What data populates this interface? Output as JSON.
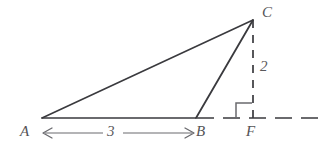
{
  "figure": {
    "type": "geometry-diagram",
    "background_color": "#ffffff",
    "stroke_color": "#3a3a3e",
    "label_color": "#555457",
    "points": {
      "A": {
        "label": "A",
        "x": 42,
        "y": 118
      },
      "B": {
        "label": "B",
        "x": 196,
        "y": 118
      },
      "C": {
        "label": "C",
        "x": 253,
        "y": 20
      },
      "F": {
        "label": "F",
        "x": 253,
        "y": 118
      }
    },
    "segments": [
      {
        "name": "AC",
        "from": "A",
        "to": "C",
        "style": "solid"
      },
      {
        "name": "AB",
        "from": "A",
        "to": "B",
        "style": "solid"
      },
      {
        "name": "BC",
        "from": "B",
        "to": "C",
        "style": "solid"
      },
      {
        "name": "CF",
        "from": "C",
        "to": "F",
        "style": "dashed"
      },
      {
        "name": "BF-extended",
        "from": "B",
        "to": "right-edge",
        "style": "dashed"
      }
    ],
    "right_angle_marker": {
      "at": "F",
      "opens_toward": "B",
      "size": 16
    },
    "measurements": [
      {
        "name": "base-length-AB",
        "value": "3",
        "between": [
          "A",
          "B"
        ],
        "orientation": "horizontal",
        "arrows": "both"
      },
      {
        "name": "height-CF",
        "value": "2",
        "between": [
          "C",
          "F"
        ],
        "orientation": "vertical",
        "arrows": "none"
      }
    ]
  }
}
